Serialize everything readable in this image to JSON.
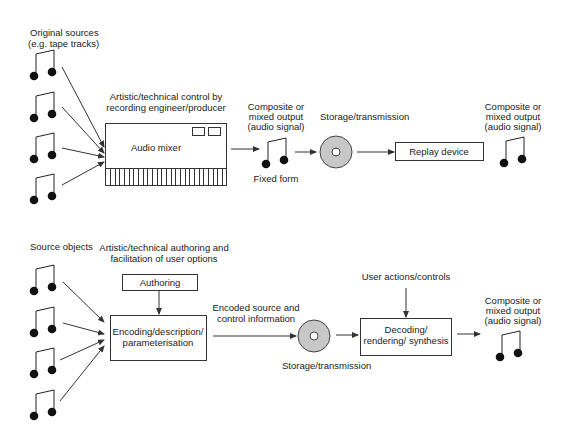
{
  "top_flow": {
    "sources_label": [
      "Original sources",
      "(e.g. tape tracks)"
    ],
    "control_label": [
      "Artistic/technical control by",
      "recording engineer/producer"
    ],
    "mixer_label": "Audio mixer",
    "output1_label": [
      "Composite or",
      "mixed output",
      "(audio signal)"
    ],
    "fixed_form_label": "Fixed form",
    "storage_label": "Storage/transmission",
    "replay_label": "Replay device",
    "output2_label": [
      "Composite or",
      "mixed output",
      "(audio signal)"
    ],
    "source_count": 4,
    "fader_count": 26
  },
  "bottom_flow": {
    "sources_label": "Source objects",
    "authoring_note": [
      "Artistic/technical authoring and",
      "facilitation of user options"
    ],
    "authoring_label": "Authoring",
    "encoding_label": [
      "Encoding/description/",
      "parameterisation"
    ],
    "encoded_label": [
      "Encoded source and",
      "control information"
    ],
    "storage_label": "Storage/transmission",
    "user_actions_label": "User actions/controls",
    "decoding_label": [
      "Decoding/",
      "rendering/ synthesis"
    ],
    "output_label": [
      "Composite or",
      "mixed output",
      "(audio signal)"
    ],
    "source_count": 4
  },
  "icons": {
    "source": "music-note-icon",
    "storage": "disc-icon"
  },
  "colors": {
    "ink": "#222222",
    "disc_fill": "#c8c8c8"
  }
}
